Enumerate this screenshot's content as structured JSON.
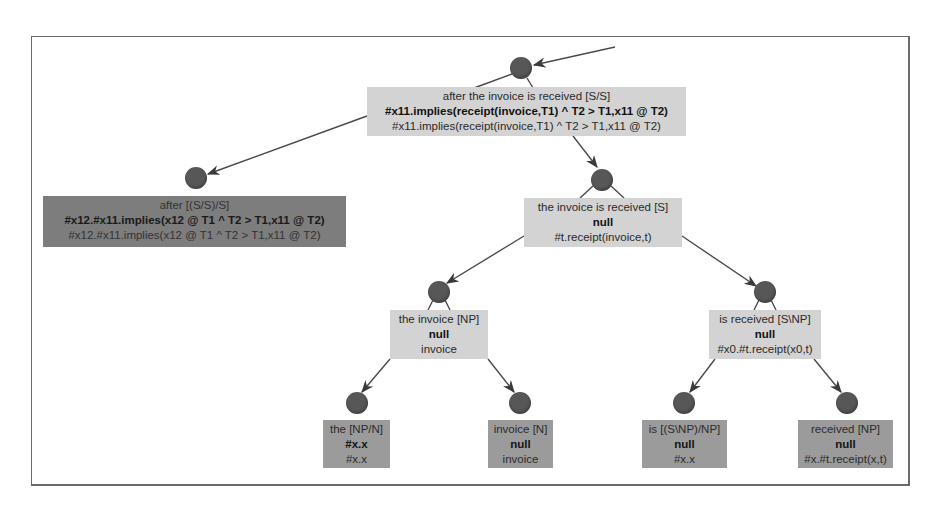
{
  "diagram": {
    "type": "ccg-derivation-tree",
    "colors": {
      "frame_border": "#6a6a6a",
      "node_dot": "#575757",
      "edge": "#4a4a4a",
      "box_intermediate": "#d3d3d3",
      "box_leaf": "#9b9b9b",
      "box_functor": "#7d7d7d"
    },
    "nodes": {
      "root": {
        "label": "after the invoice is received [S/S]",
        "bold": "#x11.implies(receipt(invoice,T1) ^ T2 > T1,x11 @ T2)",
        "semantics": "#x11.implies(receipt(invoice,T1) ^ T2 > T1,x11 @ T2)"
      },
      "after": {
        "label": "after [(S/S)/S]",
        "bold": "#x12.#x11.implies(x12 @ T1 ^ T2 > T1,x11 @ T2)",
        "semantics": "#x12.#x11.implies(x12 @ T1 ^ T2 > T1,x11 @ T2)"
      },
      "clause": {
        "label": "the invoice is received [S]",
        "bold": "null",
        "semantics": "#t.receipt(invoice,t)"
      },
      "np": {
        "label": "the invoice [NP]",
        "bold": "null",
        "semantics": "invoice"
      },
      "vp": {
        "label": "is received [S\\NP]",
        "bold": "null",
        "semantics": "#x0.#t.receipt(x0,t)"
      },
      "the": {
        "label": "the [NP/N]",
        "bold": "#x.x",
        "semantics": "#x.x"
      },
      "invoice": {
        "label": "invoice [N]",
        "bold": "null",
        "semantics": "invoice"
      },
      "is": {
        "label": "is [(S\\NP)/NP]",
        "bold": "null",
        "semantics": "#x.x"
      },
      "received": {
        "label": "received [NP]",
        "bold": "null",
        "semantics": "#x.#t.receipt(x,t)"
      }
    },
    "edges": [
      {
        "from": "external",
        "to": "root"
      },
      {
        "from": "root",
        "to": "after"
      },
      {
        "from": "root",
        "to": "clause"
      },
      {
        "from": "clause",
        "to": "np"
      },
      {
        "from": "clause",
        "to": "vp"
      },
      {
        "from": "np",
        "to": "the"
      },
      {
        "from": "np",
        "to": "invoice"
      },
      {
        "from": "vp",
        "to": "is"
      },
      {
        "from": "vp",
        "to": "received"
      }
    ]
  }
}
